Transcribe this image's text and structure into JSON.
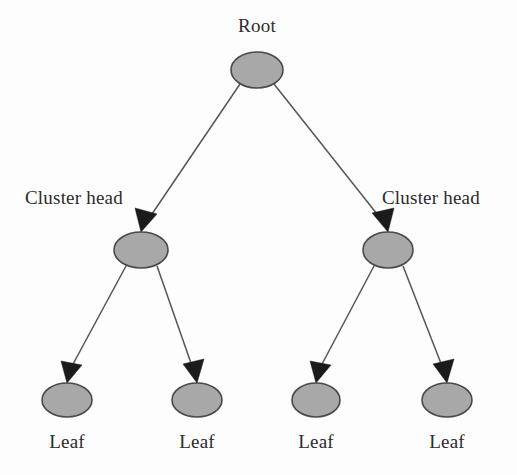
{
  "figure": {
    "type": "hierarchical-tree-diagram",
    "background_color": "#fdfdfd",
    "node_fill_color": "#a8a8a8",
    "node_stroke_color": "#4a4a4a",
    "edge_color": "#555555",
    "arrow_color": "#1b1b1b",
    "text_color": "#2b2b2b"
  },
  "labels": {
    "root": "Root",
    "cluster_head_left": "Cluster head",
    "cluster_head_right": "Cluster head",
    "leaf_1": "Leaf",
    "leaf_2": "Leaf",
    "leaf_3": "Leaf",
    "leaf_4": "Leaf"
  },
  "nodes": [
    {
      "id": "root",
      "label": "Root",
      "level": 0,
      "cx": 257,
      "cy": 70,
      "rx": 26,
      "ry": 18
    },
    {
      "id": "cluster-head-left",
      "label": "Cluster head",
      "level": 1,
      "cx": 141,
      "cy": 250,
      "rx": 27,
      "ry": 18
    },
    {
      "id": "cluster-head-right",
      "label": "Cluster head",
      "level": 1,
      "cx": 388,
      "cy": 250,
      "rx": 25,
      "ry": 18
    },
    {
      "id": "leaf-1",
      "label": "Leaf",
      "level": 2,
      "cx": 67,
      "cy": 400,
      "rx": 25,
      "ry": 17
    },
    {
      "id": "leaf-2",
      "label": "Leaf",
      "level": 2,
      "cx": 197,
      "cy": 400,
      "rx": 25,
      "ry": 17
    },
    {
      "id": "leaf-3",
      "label": "Leaf",
      "level": 2,
      "cx": 316,
      "cy": 400,
      "rx": 24,
      "ry": 17
    },
    {
      "id": "leaf-4",
      "label": "Leaf",
      "level": 2,
      "cx": 447,
      "cy": 400,
      "rx": 25,
      "ry": 17
    }
  ],
  "edges": [
    {
      "from": "root",
      "to": "cluster-head-left",
      "directed": true
    },
    {
      "from": "root",
      "to": "cluster-head-right",
      "directed": true
    },
    {
      "from": "cluster-head-left",
      "to": "leaf-1",
      "directed": true
    },
    {
      "from": "cluster-head-left",
      "to": "leaf-2",
      "directed": true
    },
    {
      "from": "cluster-head-right",
      "to": "leaf-3",
      "directed": true
    },
    {
      "from": "cluster-head-right",
      "to": "leaf-4",
      "directed": true
    }
  ]
}
